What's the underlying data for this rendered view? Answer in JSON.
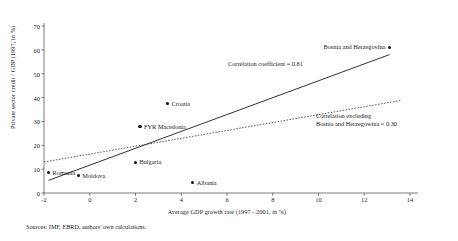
{
  "chart_data": {
    "type": "scatter",
    "title": "",
    "xlabel": "Average GDP growth rate (1997 - 2001, in %)",
    "ylabel": "Private sector credit / GDP (1997, in %)",
    "xlim": [
      -2,
      14
    ],
    "ylim": [
      0,
      70
    ],
    "xticks": [
      -2,
      0,
      2,
      4,
      6,
      8,
      10,
      12,
      14
    ],
    "yticks": [
      0,
      10,
      20,
      30,
      40,
      50,
      60,
      70
    ],
    "xtick_labels": [
      "-2",
      "0",
      "2",
      "4",
      "6",
      "8",
      "10",
      "12",
      "14"
    ],
    "ytick_labels": [
      "0",
      "10",
      "20",
      "30",
      "40",
      "50",
      "60",
      "70"
    ],
    "grid": false,
    "legend": "none",
    "marker_color": "#111111",
    "points": [
      {
        "label": "Romania",
        "x": -1.8,
        "y": 8.5,
        "label_pos": "right"
      },
      {
        "label": "Moldova",
        "x": -0.5,
        "y": 7.3,
        "label_pos": "right"
      },
      {
        "label": "Bulgaria",
        "x": 2.0,
        "y": 12.8,
        "label_pos": "right"
      },
      {
        "label": "FYR Macedonia",
        "x": 2.2,
        "y": 27.8,
        "label_pos": "right"
      },
      {
        "label": "Croatia",
        "x": 3.4,
        "y": 37.5,
        "label_pos": "right"
      },
      {
        "label": "Albania",
        "x": 4.5,
        "y": 4.3,
        "label_pos": "right"
      },
      {
        "label": "Bosnia and Herzegovina",
        "x": 13.1,
        "y": 61.0,
        "label_pos": "left"
      }
    ],
    "trendlines": [
      {
        "name": "all-countries-fit",
        "style": "solid",
        "color": "#1a1a1a",
        "x0": -1.8,
        "y0": 5.3,
        "x1": 13.1,
        "y1": 58.0,
        "annotation": "Correlation coefficient = 0.81",
        "correlation": 0.81
      },
      {
        "name": "excluding-bih-fit",
        "style": "dotted",
        "color": "#1a1a1a",
        "x0": -2.0,
        "y0": 13.0,
        "x1": 13.6,
        "y1": 38.8,
        "annotation_line1": "Correlation excluding",
        "annotation_line2": "Bosnia and Herzegowina = 0.30",
        "correlation": 0.3
      }
    ],
    "annotations": [
      {
        "text": "Correlation coefficient = 0.81",
        "x": 7.2,
        "y": 48.5
      },
      {
        "text": "Correlation excluding",
        "x": 11.2,
        "y": 27.0
      },
      {
        "text": "Bosnia and Herzegowina = 0.30",
        "x": 11.2,
        "y": 24.0
      }
    ]
  },
  "annotation_main": "Correlation coefficient = 0.81",
  "annotation_excluding_line1": "Correlation excluding",
  "annotation_excluding_line2": "Bosnia and Herzegowina = 0.30",
  "source_note": "Sources: IMF, EBRD, authors' own calculations."
}
